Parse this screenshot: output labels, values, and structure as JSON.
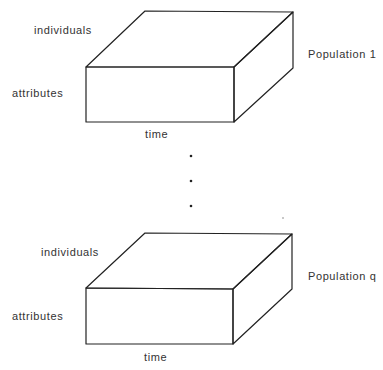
{
  "diagram": {
    "type": "stacked-data-cubes",
    "stroke_color": "#222222",
    "background": "#ffffff",
    "populations": [
      {
        "name": "Population 1",
        "axes": {
          "depth": "individuals",
          "height": "attributes",
          "width": "time"
        }
      },
      {
        "name": "Population q",
        "axes": {
          "depth": "individuals",
          "height": "attributes",
          "width": "time"
        }
      }
    ],
    "ellipsis": "vertical dots indicating populations between 1 and q"
  }
}
